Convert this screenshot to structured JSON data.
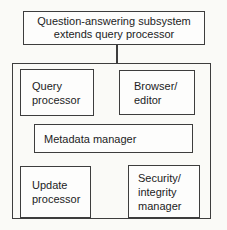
{
  "diagram": {
    "title_box": {
      "label": "Question-answering subsystem\nextends query processor"
    },
    "modules": {
      "query_processor": {
        "label": "Query\nprocessor"
      },
      "browser_editor": {
        "label": "Browser/\neditor"
      },
      "metadata_manager": {
        "label": "Metadata manager"
      },
      "update_processor": {
        "label": "Update\nprocessor"
      },
      "security_integrity_manager": {
        "label": "Security/\nintegrity\nmanager"
      }
    },
    "colors": {
      "border": "#3d3d3d",
      "text": "#1c1c1c",
      "background": "#fafaf7",
      "box_fill": "#fdfdfc"
    }
  }
}
